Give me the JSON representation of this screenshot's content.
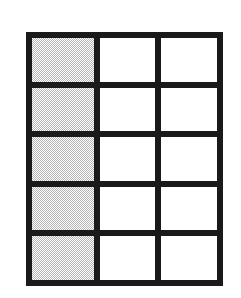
{
  "figure": {
    "background_color": "#ffffff",
    "rule_color": "#1a1a1a",
    "shade_color": "#b4b4b4",
    "empty_color": "#ffffff"
  },
  "table": {
    "row_count": 5,
    "column_count": 3,
    "border_thickness_px": 6,
    "rows": [
      {
        "index": 0,
        "cells": [
          {
            "column": 0,
            "state": "shaded",
            "text": ""
          },
          {
            "column": 1,
            "state": "empty",
            "text": ""
          },
          {
            "column": 2,
            "state": "empty",
            "text": ""
          }
        ]
      },
      {
        "index": 1,
        "cells": [
          {
            "column": 0,
            "state": "shaded",
            "text": ""
          },
          {
            "column": 1,
            "state": "empty",
            "text": ""
          },
          {
            "column": 2,
            "state": "empty",
            "text": ""
          }
        ]
      },
      {
        "index": 2,
        "cells": [
          {
            "column": 0,
            "state": "shaded",
            "text": ""
          },
          {
            "column": 1,
            "state": "empty",
            "text": ""
          },
          {
            "column": 2,
            "state": "empty",
            "text": ""
          }
        ]
      },
      {
        "index": 3,
        "cells": [
          {
            "column": 0,
            "state": "shaded",
            "text": ""
          },
          {
            "column": 1,
            "state": "empty",
            "text": ""
          },
          {
            "column": 2,
            "state": "empty",
            "text": ""
          }
        ]
      },
      {
        "index": 4,
        "cells": [
          {
            "column": 0,
            "state": "shaded",
            "text": ""
          },
          {
            "column": 1,
            "state": "empty",
            "text": ""
          },
          {
            "column": 2,
            "state": "empty",
            "text": ""
          }
        ]
      }
    ]
  }
}
